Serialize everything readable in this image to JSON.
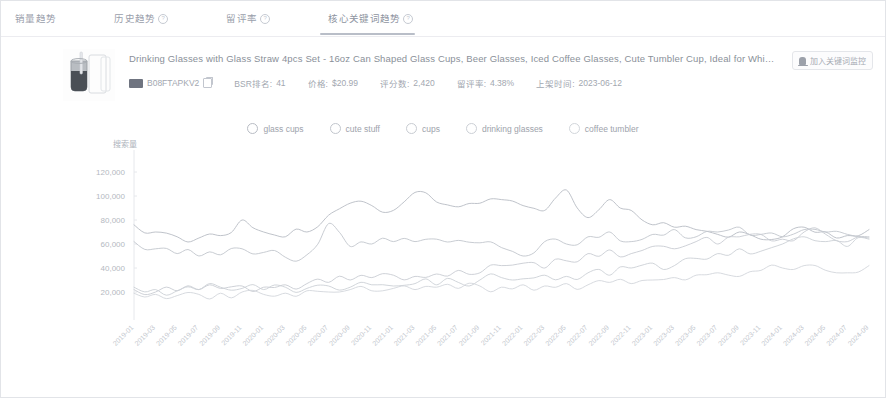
{
  "tabs": [
    {
      "label": "销量趋势",
      "has_help": false,
      "active": false
    },
    {
      "label": "历史趋势",
      "has_help": true,
      "active": false
    },
    {
      "label": "留评率",
      "has_help": true,
      "active": false
    },
    {
      "label": "核心关键词趋势",
      "has_help": true,
      "active": true
    }
  ],
  "product": {
    "title": "Drinking Glasses with Glass Straw 4pcs Set - 16oz Can Shaped Glass Cups, Beer Glasses, Iced Coffee Glasses, Cute Tumbler Cup, Ideal for Whiskey,",
    "asin": "B08FTAPKV2",
    "bsr_label": "BSR排名:",
    "bsr_value": "41",
    "price_label": "价格:",
    "price_value": "$20.99",
    "ratings_label": "评分数:",
    "ratings_value": "2,420",
    "review_rate_label": "留评率:",
    "review_rate_value": "4.38%",
    "listed_label": "上架时间:",
    "listed_value": "2023-06-12",
    "track_button": "加入关键词监控",
    "thumb_icon": "glass-cup-product-image",
    "amazon_icon": "amazon-badge-icon",
    "copy_icon": "copy-icon",
    "bell_icon": "bell-icon"
  },
  "chart_data": {
    "type": "line",
    "title": "",
    "xlabel": "",
    "ylabel": "搜索量",
    "ylim": [
      0,
      130000
    ],
    "grid": false,
    "legend_position": "top-center",
    "yticks": [
      "120,000",
      "100,000",
      "80,000",
      "60,000",
      "40,000",
      "20,000"
    ],
    "ytick_values": [
      120000,
      100000,
      80000,
      60000,
      40000,
      20000
    ],
    "x": [
      "2019-01",
      "2019-03",
      "2019-05",
      "2019-07",
      "2019-09",
      "2019-11",
      "2020-01",
      "2020-03",
      "2020-05",
      "2020-07",
      "2020-09",
      "2020-11",
      "2021-01",
      "2021-03",
      "2021-05",
      "2021-07",
      "2021-09",
      "2021-11",
      "2022-01",
      "2022-03",
      "2022-05",
      "2022-07",
      "2022-09",
      "2022-11",
      "2023-01",
      "2023-03",
      "2023-05",
      "2023-07",
      "2023-09",
      "2023-11",
      "2024-01",
      "2024-03",
      "2024-05",
      "2024-07",
      "2024-09"
    ],
    "series": [
      {
        "name": "glass cups",
        "color": "#b8bcc4",
        "values": [
          76000,
          70000,
          66000,
          65000,
          67000,
          80000,
          70000,
          66000,
          70000,
          84000,
          94000,
          92000,
          88000,
          103000,
          95000,
          91000,
          94000,
          97000,
          92000,
          88000,
          105000,
          82000,
          97000,
          88000,
          76000,
          74000,
          72000,
          68000,
          70000,
          64000,
          66000,
          74000,
          70000,
          67000,
          72000
        ]
      },
      {
        "name": "cute stuff",
        "color": "#c2c6cd",
        "values": [
          62000,
          56000,
          52000,
          50000,
          51000,
          56000,
          53000,
          49000,
          51000,
          77000,
          58000,
          60000,
          62000,
          62000,
          64000,
          63000,
          61000,
          57000,
          50000,
          62000,
          60000,
          66000,
          70000,
          62000,
          68000,
          72000,
          66000,
          70000,
          74000,
          68000,
          66000,
          72000,
          70000,
          68000,
          65000
        ]
      },
      {
        "name": "cups",
        "color": "#c8ccd2",
        "values": [
          22000,
          20000,
          21000,
          22000,
          23000,
          25000,
          24000,
          26000,
          27000,
          28000,
          30000,
          32000,
          34000,
          33000,
          35000,
          38000,
          36000,
          42000,
          44000,
          40000,
          46000,
          52000,
          55000,
          52000,
          58000,
          56000,
          62000,
          60000,
          66000,
          68000,
          64000,
          70000,
          68000,
          62000,
          66000
        ]
      },
      {
        "name": "drinking glasses",
        "color": "#ccd0d6",
        "values": [
          24000,
          22000,
          21000,
          22000,
          24000,
          23000,
          22000,
          24000,
          23000,
          25000,
          24000,
          26000,
          25000,
          27000,
          26000,
          28000,
          30000,
          32000,
          31000,
          34000,
          33000,
          36000,
          34000,
          40000,
          44000,
          42000,
          48000,
          52000,
          56000,
          54000,
          60000,
          66000,
          62000,
          58000,
          64000
        ]
      },
      {
        "name": "coffee tumbler",
        "color": "#d2d6db",
        "values": [
          19000,
          18000,
          17000,
          18000,
          19000,
          20000,
          18000,
          19000,
          21000,
          20000,
          22000,
          21000,
          23000,
          22000,
          24000,
          23000,
          25000,
          24000,
          26000,
          25000,
          27000,
          26000,
          28000,
          27000,
          30000,
          32000,
          34000,
          36000,
          33000,
          38000,
          40000,
          42000,
          38000,
          36000,
          42000
        ]
      }
    ]
  }
}
